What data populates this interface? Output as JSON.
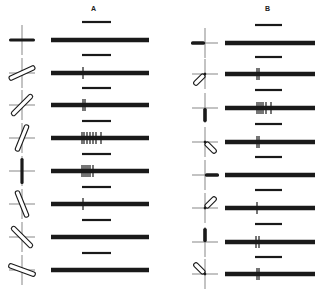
{
  "columns": [
    {
      "label": "A",
      "label_x": 93,
      "label_y": 12,
      "icon_cx": 22,
      "bar_x1": 51,
      "bar_x2": 149,
      "short_x1": 82,
      "short_x2": 111,
      "rows": [
        {
          "y": 40,
          "icon": {
            "type": "solid",
            "angle": 0
          },
          "ticks": []
        },
        {
          "y": 73,
          "icon": {
            "type": "hollow",
            "angle": 25
          },
          "ticks": [
            83
          ]
        },
        {
          "y": 105,
          "icon": {
            "type": "hollow",
            "angle": 45
          },
          "ticks": [
            83,
            85
          ]
        },
        {
          "y": 138,
          "icon": {
            "type": "hollow",
            "angle": 68
          },
          "ticks": [
            82,
            84,
            87,
            90,
            93,
            96,
            101
          ]
        },
        {
          "y": 171,
          "icon": {
            "type": "solid",
            "angle": 90
          },
          "ticks": [
            82,
            84,
            86,
            88,
            90,
            93
          ]
        },
        {
          "y": 204,
          "icon": {
            "type": "hollow",
            "angle": 112
          },
          "ticks": [
            83
          ]
        },
        {
          "y": 237,
          "icon": {
            "type": "hollow",
            "angle": 135
          },
          "ticks": []
        },
        {
          "y": 270,
          "icon": {
            "type": "hollow",
            "angle": 160
          },
          "ticks": []
        }
      ],
      "short_bars_y": [
        22,
        55,
        88,
        121,
        154,
        187,
        220,
        253
      ]
    },
    {
      "label": "B",
      "label_x": 267,
      "label_y": 12,
      "icon_cx": 205,
      "bar_x1": 225,
      "bar_x2": 315,
      "short_x1": 255,
      "short_x2": 282,
      "rows": [
        {
          "y": 43,
          "icon": {
            "type": "half-solid",
            "angle": 180
          },
          "ticks": []
        },
        {
          "y": 74,
          "icon": {
            "type": "half-hollow",
            "angle": 225
          },
          "ticks": [
            257,
            259
          ]
        },
        {
          "y": 108,
          "icon": {
            "type": "half-solid",
            "angle": 270
          },
          "ticks": [
            257,
            259,
            261,
            263,
            266,
            271
          ]
        },
        {
          "y": 142,
          "icon": {
            "type": "half-hollow",
            "angle": 315
          },
          "ticks": [
            257,
            259
          ]
        },
        {
          "y": 175,
          "icon": {
            "type": "half-solid",
            "angle": 0
          },
          "ticks": []
        },
        {
          "y": 208,
          "icon": {
            "type": "half-hollow",
            "angle": 45
          },
          "ticks": [
            257
          ]
        },
        {
          "y": 242,
          "icon": {
            "type": "half-solid",
            "angle": 90
          },
          "ticks": [
            256,
            259
          ]
        },
        {
          "y": 274,
          "icon": {
            "type": "half-hollow",
            "angle": 135
          },
          "ticks": [
            257,
            259
          ]
        }
      ],
      "short_bars_y": [
        25,
        57,
        90,
        124,
        157,
        190,
        224,
        257
      ]
    }
  ],
  "colors": {
    "ink": "#1a1a1a",
    "axis": "#555555",
    "background": "#ffffff"
  }
}
